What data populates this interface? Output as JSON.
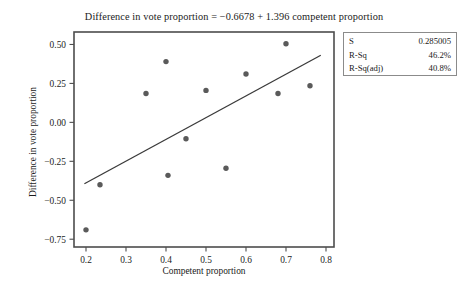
{
  "chart_data": {
    "type": "scatter",
    "title": "Difference in vote proportion = −0.6678 + 1.396 competent proportion",
    "xlabel": "Competent proportion",
    "ylabel": "Difference in vote proportion",
    "xlim": [
      0.17,
      0.82
    ],
    "ylim": [
      -0.8,
      0.58
    ],
    "xticks": [
      0.2,
      0.3,
      0.4,
      0.5,
      0.6,
      0.7,
      0.8
    ],
    "xtick_labels": [
      "0.2",
      "0.3",
      "0.4",
      "0.5",
      "0.6",
      "0.7",
      "0.8"
    ],
    "yticks": [
      0.5,
      0.25,
      0.0,
      -0.25,
      -0.5,
      -0.75
    ],
    "ytick_labels": [
      "0.50",
      "0.25",
      "0.00",
      "−0.25",
      "−0.50",
      "−0.75"
    ],
    "grid": false,
    "legend": "none",
    "marker_color": "#5a5a5a",
    "line_color": "#3a3a3a",
    "frame_color": "#4d4d4d",
    "points": [
      {
        "x": 0.2,
        "y": -0.69
      },
      {
        "x": 0.235,
        "y": -0.4
      },
      {
        "x": 0.35,
        "y": 0.185
      },
      {
        "x": 0.4,
        "y": 0.39
      },
      {
        "x": 0.405,
        "y": -0.34
      },
      {
        "x": 0.45,
        "y": -0.105
      },
      {
        "x": 0.5,
        "y": 0.205
      },
      {
        "x": 0.55,
        "y": -0.295
      },
      {
        "x": 0.6,
        "y": 0.31
      },
      {
        "x": 0.68,
        "y": 0.185
      },
      {
        "x": 0.7,
        "y": 0.505
      },
      {
        "x": 0.76,
        "y": 0.235
      }
    ],
    "fit_line": {
      "intercept": -0.6678,
      "slope": 1.396,
      "x_start": 0.196,
      "x_end": 0.787
    }
  },
  "stats_box": {
    "rows": [
      {
        "key": "S",
        "value": "0.285005"
      },
      {
        "key": "R-Sq",
        "value": "46.2%"
      },
      {
        "key": "R-Sq(adj)",
        "value": "40.8%"
      }
    ]
  }
}
